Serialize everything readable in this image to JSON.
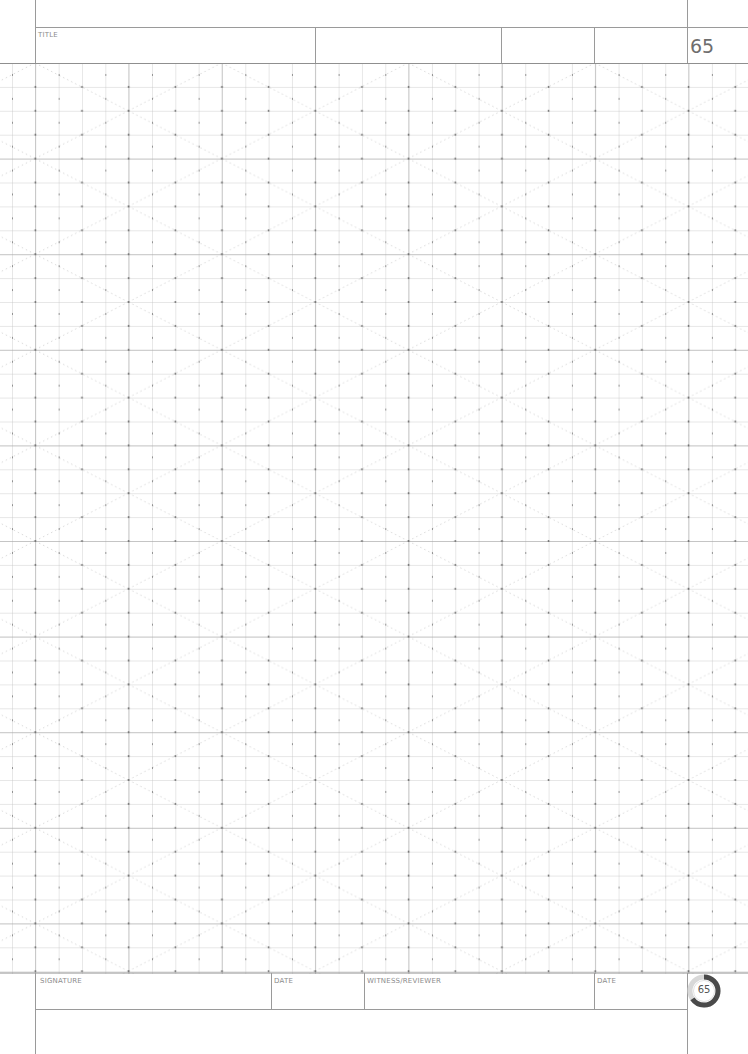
{
  "header": {
    "title_label": "TITLE",
    "page_number": "65"
  },
  "footer": {
    "signature_label": "SIGNATURE",
    "date_label_1": "DATE",
    "witness_label": "WITNESS/REVIEWER",
    "date_label_2": "DATE",
    "badge_number": "65"
  },
  "grid": {
    "type": "square grid with isometric dot overlay and dotted diagonals",
    "line_color": "#bdbdbd",
    "major_line_color": "#8f8f8f",
    "dot_color": "#6a6a6a",
    "diagonal_color": "#c8c8c8"
  }
}
